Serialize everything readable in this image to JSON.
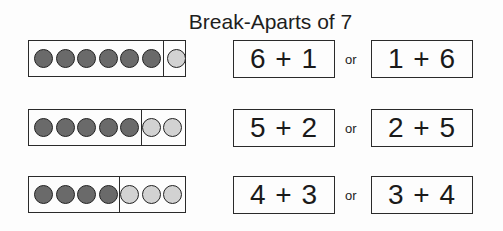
{
  "title": "Break-Aparts of 7",
  "colors": {
    "dark_dot": "#6a6a6a",
    "light_dot": "#d2d2d2",
    "border": "#2a2a2a"
  },
  "rows": [
    {
      "dark": 6,
      "light": 1,
      "left_eq": "6 + 1",
      "connector": "or",
      "right_eq": "1 + 6"
    },
    {
      "dark": 5,
      "light": 2,
      "left_eq": "5 + 2",
      "connector": "or",
      "right_eq": "2 + 5"
    },
    {
      "dark": 4,
      "light": 3,
      "left_eq": "4 + 3",
      "connector": "or",
      "right_eq": "3 + 4"
    }
  ]
}
